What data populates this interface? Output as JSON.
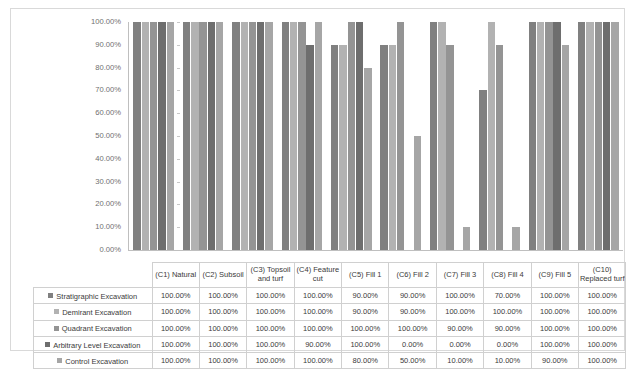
{
  "chart_data": {
    "type": "bar",
    "title": "",
    "subtitle": "",
    "xlabel": "",
    "ylabel": "",
    "ylim": [
      0,
      100
    ],
    "y_tick_labels": [
      "100.00%",
      "90.00%",
      "80.00%",
      "70.00%",
      "60.00%",
      "50.00%",
      "40.00%",
      "30.00%",
      "20.00%",
      "10.00%",
      "0.00%"
    ],
    "y_tick_values": [
      100,
      90,
      80,
      70,
      60,
      50,
      40,
      30,
      20,
      10,
      0
    ],
    "grid": false,
    "legend_position": "table",
    "value_suffix": "%",
    "categories": [
      "(C1) Natural",
      "(C2) Subsoil",
      "(C3) Topsoil and turf",
      "(C4) Feature cut",
      "(C5) Fill 1",
      "(C6) Fill 2",
      "(C7) Fill 3",
      "(C8) Fill 4",
      "(C9) Fill 5",
      "(C10) Replaced turf"
    ],
    "series": [
      {
        "name": "Stratigraphic Excavation",
        "color": "#808080",
        "values": [
          100,
          100,
          100,
          100,
          90,
          90,
          100,
          70,
          100,
          100
        ],
        "labels": [
          "100.00%",
          "100.00%",
          "100.00%",
          "100.00%",
          "90.00%",
          "90.00%",
          "100.00%",
          "70.00%",
          "100.00%",
          "100.00%"
        ]
      },
      {
        "name": "Demirant Excavation",
        "color": "#b2b2b2",
        "values": [
          100,
          100,
          100,
          100,
          90,
          90,
          100,
          100,
          100,
          100
        ],
        "labels": [
          "100.00%",
          "100.00%",
          "100.00%",
          "100.00%",
          "90.00%",
          "90.00%",
          "100.00%",
          "100.00%",
          "100.00%",
          "100.00%"
        ]
      },
      {
        "name": "Quadrant Excavation",
        "color": "#949494",
        "values": [
          100,
          100,
          100,
          100,
          100,
          100,
          90,
          90,
          100,
          100
        ],
        "labels": [
          "100.00%",
          "100.00%",
          "100.00%",
          "100.00%",
          "100.00%",
          "100.00%",
          "90.00%",
          "90.00%",
          "100.00%",
          "100.00%"
        ]
      },
      {
        "name": "Arbitrary Level Excavation",
        "color": "#6e6e6e",
        "values": [
          100,
          100,
          100,
          90,
          100,
          0,
          0,
          0,
          100,
          100
        ],
        "labels": [
          "100.00%",
          "100.00%",
          "100.00%",
          "90.00%",
          "100.00%",
          "0.00%",
          "0.00%",
          "0.00%",
          "100.00%",
          "100.00%"
        ]
      },
      {
        "name": "Control Excavation",
        "color": "#a6a6a6",
        "values": [
          100,
          100,
          100,
          100,
          80,
          50,
          10,
          10,
          90,
          100
        ],
        "labels": [
          "100.00%",
          "100.00%",
          "100.00%",
          "100.00%",
          "80.00%",
          "50.00%",
          "10.00%",
          "10.00%",
          "90.00%",
          "100.00%"
        ]
      }
    ]
  },
  "colors": {
    "frame_border": "#d9d9d9",
    "axis_line": "#bfbfbf",
    "table_border": "#d0d0d0",
    "tick_text": "#6f6f6f",
    "table_text": "#3a3a3a"
  }
}
